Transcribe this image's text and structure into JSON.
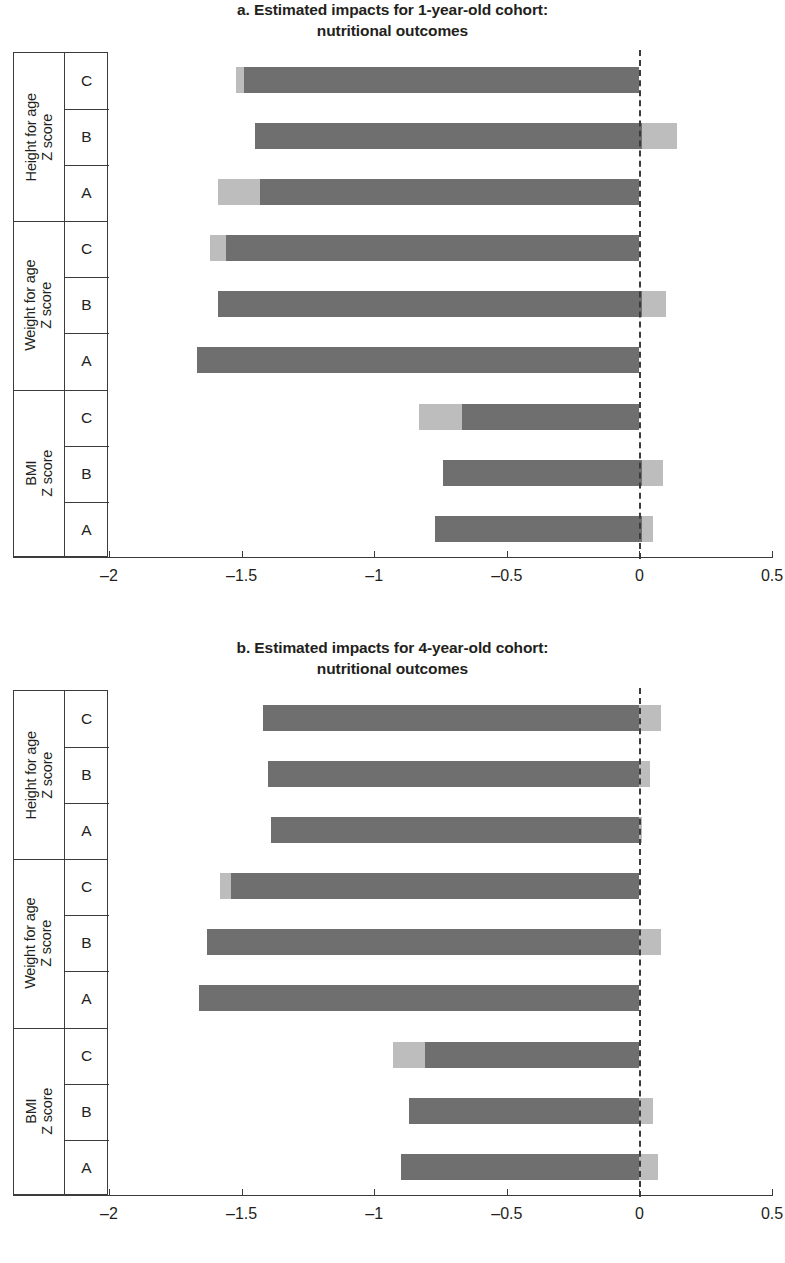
{
  "figure": {
    "axis_color": "#3b3b3b",
    "bar_dark_color": "#6f6f6f",
    "bar_light_color": "#bdbdbd"
  },
  "panels": {
    "a": {
      "title_line1": "a. Estimated impacts for 1-year-old cohort:",
      "title_line2": "nutritional outcomes"
    },
    "b": {
      "title_line1": "b. Estimated impacts for 4-year-old cohort:",
      "title_line2": "nutritional outcomes"
    }
  },
  "axis": {
    "x_ticks": [
      "-2",
      "-1.5",
      "-1",
      "-0.5",
      "0",
      "0.5"
    ],
    "x_tick_values": [
      -2,
      -1.5,
      -1,
      -0.5,
      0,
      0.5
    ],
    "xmin": -2,
    "xmax": 0.5,
    "groups": [
      {
        "label_line1": "Height for age",
        "label_line2": "Z score",
        "subs": [
          "C",
          "B",
          "A"
        ]
      },
      {
        "label_line1": "Weight for age",
        "label_line2": "Z score",
        "subs": [
          "C",
          "B",
          "A"
        ]
      },
      {
        "label_line1": "BMI",
        "label_line2": "Z score",
        "subs": [
          "C",
          "B",
          "A"
        ]
      }
    ]
  },
  "chart_data": [
    {
      "type": "bar",
      "orientation": "horizontal",
      "title": "a. Estimated impacts for 1-year-old cohort: nutritional outcomes",
      "xlabel": "",
      "ylabel": "",
      "xlim": [
        -2,
        0.5
      ],
      "xticks": [
        -2,
        -1.5,
        -1,
        -0.5,
        0,
        0.5
      ],
      "grid": false,
      "legend": "none",
      "reference_line": 0,
      "note": "Each bar is a confidence interval: the light segments are the interval tails beyond the dark estimate band.",
      "categories": [
        "Height for age Z score - C",
        "Height for age Z score - B",
        "Height for age Z score - A",
        "Weight for age Z score - C",
        "Weight for age Z score - B",
        "Weight for age Z score - A",
        "BMI Z score - C",
        "BMI Z score - B",
        "BMI Z score - A"
      ],
      "bars": [
        {
          "group": "Height for age Z score",
          "sub": "C",
          "low": -1.52,
          "high": 0.0,
          "dark_low": -1.49,
          "dark_high": 0.0
        },
        {
          "group": "Height for age Z score",
          "sub": "B",
          "low": -1.45,
          "high": 0.14,
          "dark_low": -1.45,
          "dark_high": 0.01
        },
        {
          "group": "Height for age Z score",
          "sub": "A",
          "low": -1.59,
          "high": 0.0,
          "dark_low": -1.43,
          "dark_high": 0.0
        },
        {
          "group": "Weight for age Z score",
          "sub": "C",
          "low": -1.62,
          "high": 0.0,
          "dark_low": -1.56,
          "dark_high": 0.0
        },
        {
          "group": "Weight for age Z score",
          "sub": "B",
          "low": -1.59,
          "high": 0.1,
          "dark_low": -1.59,
          "dark_high": 0.01
        },
        {
          "group": "Weight for age Z score",
          "sub": "A",
          "low": -1.67,
          "high": 0.0,
          "dark_low": -1.67,
          "dark_high": 0.0
        },
        {
          "group": "BMI Z score",
          "sub": "C",
          "low": -0.83,
          "high": 0.0,
          "dark_low": -0.67,
          "dark_high": 0.0
        },
        {
          "group": "BMI Z score",
          "sub": "B",
          "low": -0.74,
          "high": 0.09,
          "dark_low": -0.74,
          "dark_high": 0.01
        },
        {
          "group": "BMI Z score",
          "sub": "A",
          "low": -0.77,
          "high": 0.05,
          "dark_low": -0.77,
          "dark_high": 0.01
        }
      ]
    },
    {
      "type": "bar",
      "orientation": "horizontal",
      "title": "b. Estimated impacts for 4-year-old cohort: nutritional outcomes",
      "xlabel": "",
      "ylabel": "",
      "xlim": [
        -2,
        0.5
      ],
      "xticks": [
        -2,
        -1.5,
        -1,
        -0.5,
        0,
        0.5
      ],
      "grid": false,
      "legend": "none",
      "reference_line": 0,
      "note": "Each bar is a confidence interval: the light segments are the interval tails beyond the dark estimate band.",
      "categories": [
        "Height for age Z score - C",
        "Height for age Z score - B",
        "Height for age Z score - A",
        "Weight for age Z score - C",
        "Weight for age Z score - B",
        "Weight for age Z score - A",
        "BMI Z score - C",
        "BMI Z score - B",
        "BMI Z score - A"
      ],
      "bars": [
        {
          "group": "Height for age Z score",
          "sub": "C",
          "low": -1.42,
          "high": 0.08,
          "dark_low": -1.42,
          "dark_high": 0.0
        },
        {
          "group": "Height for age Z score",
          "sub": "B",
          "low": -1.4,
          "high": 0.04,
          "dark_low": -1.4,
          "dark_high": 0.0
        },
        {
          "group": "Height for age Z score",
          "sub": "A",
          "low": -1.39,
          "high": 0.01,
          "dark_low": -1.39,
          "dark_high": 0.0
        },
        {
          "group": "Weight for age Z score",
          "sub": "C",
          "low": -1.58,
          "high": 0.0,
          "dark_low": -1.54,
          "dark_high": 0.0
        },
        {
          "group": "Weight for age Z score",
          "sub": "B",
          "low": -1.63,
          "high": 0.08,
          "dark_low": -1.63,
          "dark_high": 0.0
        },
        {
          "group": "Weight for age Z score",
          "sub": "A",
          "low": -1.66,
          "high": 0.0,
          "dark_low": -1.66,
          "dark_high": 0.0
        },
        {
          "group": "BMI Z score",
          "sub": "C",
          "low": -0.93,
          "high": 0.0,
          "dark_low": -0.81,
          "dark_high": 0.0
        },
        {
          "group": "BMI Z score",
          "sub": "B",
          "low": -0.87,
          "high": 0.05,
          "dark_low": -0.87,
          "dark_high": 0.0
        },
        {
          "group": "BMI Z score",
          "sub": "A",
          "low": -0.9,
          "high": 0.07,
          "dark_low": -0.9,
          "dark_high": 0.0
        }
      ]
    }
  ]
}
